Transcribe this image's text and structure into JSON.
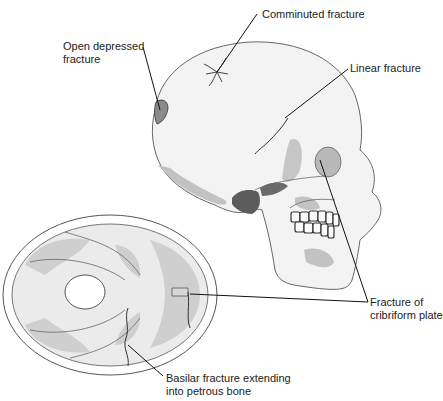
{
  "figure": {
    "colors": {
      "bone_fill": "#f2f2f2",
      "shade": "#bdbdbd",
      "dark_shade": "#5a5a5a",
      "outline": "#555555",
      "leader": "#111111"
    }
  },
  "labels": {
    "comminuted": "Comminuted fracture",
    "open_depressed_line1": "Open depressed",
    "open_depressed_line2": "fracture",
    "linear": "Linear fracture",
    "cribriform_line1": "Fracture of",
    "cribriform_line2": "cribriform plate",
    "basilar_line1": "Basilar fracture extending",
    "basilar_line2": "into petrous bone"
  }
}
